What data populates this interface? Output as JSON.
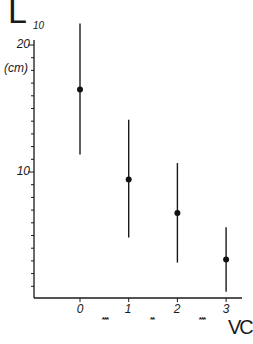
{
  "chart_data": {
    "type": "scatter",
    "subtype": "point with error bars",
    "title": "",
    "ylabel": "L10",
    "ylabel_main": "L",
    "ylabel_subscript": "10",
    "yunit": "(cm)",
    "xlabel": "VC",
    "yscale": "log",
    "ylim": [
      5,
      22.5
    ],
    "ytick_labels": [
      "20",
      "10"
    ],
    "yticks": [
      20,
      10
    ],
    "xticks": [
      0,
      1,
      2,
      3
    ],
    "xtick_labels": [
      "0",
      "1",
      "2",
      "3"
    ],
    "grid": false,
    "legend": null,
    "x": [
      0,
      1,
      2,
      3
    ],
    "values": [
      15.7,
      9.6,
      8.0,
      6.2
    ],
    "error_upper": [
      22.5,
      13.3,
      10.5,
      7.4
    ],
    "error_lower": [
      11.0,
      7.0,
      6.1,
      5.2
    ],
    "annotations": [
      {
        "text": "***",
        "between": [
          0,
          1
        ]
      },
      {
        "text": "**",
        "between": [
          1,
          2
        ]
      },
      {
        "text": "***",
        "between": [
          2,
          3
        ]
      }
    ]
  },
  "labels": {
    "y_main": "L",
    "y_sub": "10",
    "y_unit": "(cm)",
    "y20": "20",
    "y10": "10",
    "x0": "0",
    "x1": "1",
    "x2": "2",
    "x3": "3",
    "sig01": "***",
    "sig12": "**",
    "sig23": "***",
    "x_title": "VC"
  }
}
